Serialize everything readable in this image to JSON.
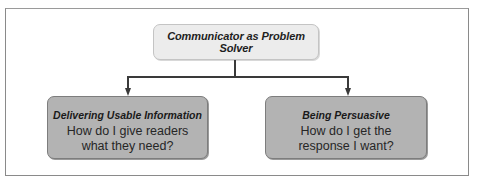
{
  "diagram": {
    "type": "hierarchy",
    "root": {
      "title": "Communicator as Problem Solver"
    },
    "children": [
      {
        "heading": "Delivering Usable Information",
        "question_line1": "How do I give readers",
        "question_line2": "what they need?"
      },
      {
        "heading": "Being Persuasive",
        "question_line1": "How do I get the",
        "question_line2": "response I want?"
      }
    ],
    "colors": {
      "root_fill": "#ececec",
      "child_fill": "#b3b3b3",
      "connector": "#3a3a3a",
      "frame_border": "#8a8a8a"
    }
  }
}
